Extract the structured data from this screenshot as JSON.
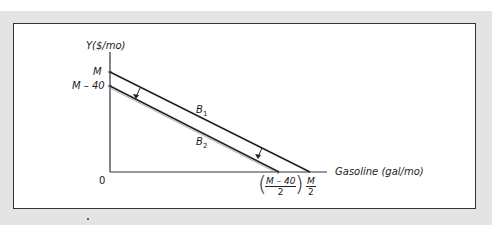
{
  "figure": {
    "y_axis_label": "Y($/mo)",
    "x_axis_label": "Gasoline (gal/mo)",
    "origin_label": "0",
    "y_ticks": [
      {
        "label": "M",
        "italic_part": "M"
      },
      {
        "label": "M – 40"
      }
    ],
    "x_ticks": [
      {
        "numerator": "M – 40",
        "denominator": "2",
        "parenthesized": true
      },
      {
        "numerator": "M",
        "denominator": "2",
        "parenthesized": false
      }
    ],
    "lines": [
      {
        "name": "B1",
        "label_base": "B",
        "label_sub": "1",
        "from": "M",
        "to": "M/2"
      },
      {
        "name": "B2",
        "label_base": "B",
        "label_sub": "2",
        "from": "M – 40",
        "to": "(M – 40)/2"
      }
    ],
    "arrows": [
      {
        "description": "shift from B1 down to B2",
        "position": "upper-left"
      },
      {
        "description": "shift from B1 down to B2",
        "position": "lower-right"
      }
    ]
  },
  "colors": {
    "line": "#222222",
    "band": "#e4e4e4",
    "frame_bg": "#ffffff"
  }
}
